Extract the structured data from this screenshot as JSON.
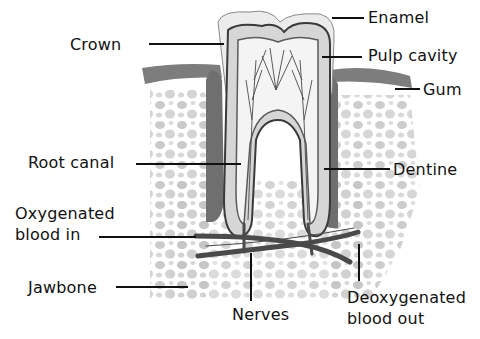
{
  "diagram": {
    "labels": [
      {
        "id": "crown",
        "text": "Crown"
      },
      {
        "id": "enamel",
        "text": "Enamel"
      },
      {
        "id": "pulp-cavity",
        "text": "Pulp cavity"
      },
      {
        "id": "gum",
        "text": "Gum"
      },
      {
        "id": "root-canal",
        "text": "Root canal"
      },
      {
        "id": "dentine",
        "text": "Dentine"
      },
      {
        "id": "oxygenated-blood-in",
        "line1": "Oxygenated",
        "line2": "blood in"
      },
      {
        "id": "jawbone",
        "text": "Jawbone"
      },
      {
        "id": "nerves",
        "text": "Nerves"
      },
      {
        "id": "deoxygenated-blood-out",
        "line1": "Deoxygenated",
        "line2": "blood out"
      }
    ]
  },
  "colors": {
    "text": "#111111",
    "leader_line": "#111111",
    "tooth_outline": "#3a3a3a",
    "enamel_fill": "#ececec",
    "dentine_fill": "#d6d6d6",
    "pulp_fill": "#f4f4f4",
    "gum_fill": "#8a8a8a",
    "bone_dots": "#bdbdbd"
  }
}
